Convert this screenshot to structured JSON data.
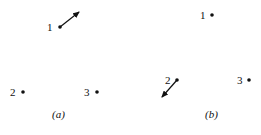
{
  "colors": {
    "ink": "#111111",
    "background": "#ffffff"
  },
  "panels": [
    {
      "caption": "(a)",
      "points": [
        {
          "label": "1",
          "has_arrow": true,
          "arrow_direction": "up-right"
        },
        {
          "label": "2",
          "has_arrow": false
        },
        {
          "label": "3",
          "has_arrow": false
        }
      ]
    },
    {
      "caption": "(b)",
      "points": [
        {
          "label": "1",
          "has_arrow": false
        },
        {
          "label": "2",
          "has_arrow": true,
          "arrow_direction": "down-left"
        },
        {
          "label": "3",
          "has_arrow": false
        }
      ]
    }
  ]
}
